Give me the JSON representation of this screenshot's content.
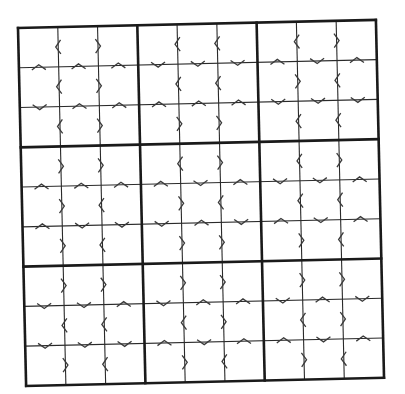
{
  "puzzle": {
    "title": "Greater-Than Sudoku",
    "size": 9,
    "box_size": 3,
    "colors": {
      "background": "#ffffff",
      "thick_line": "#1a1a1a",
      "thin_line": "#2a2a2a",
      "chevron": "#3a3a3a"
    },
    "geometry": {
      "origin_x": 18,
      "origin_y": 28,
      "grid_size": 358,
      "rotation_deg": -1.3
    },
    "legend": {
      "h_symbols": "< means left cell is smaller, > means left cell is greater",
      "v_symbols": "^ means top cell is smaller, v means top cell is greater"
    },
    "boxes": [
      {
        "name": "box-1",
        "rows": [
          [
            "<",
            ">"
          ],
          [
            "<",
            ">"
          ],
          [
            "<",
            ">"
          ]
        ],
        "cols": [
          [
            "^",
            "^",
            "^"
          ],
          [
            "v",
            "^",
            "^"
          ]
        ]
      },
      {
        "name": "box-2",
        "rows": [
          [
            "<",
            "<"
          ],
          [
            "<",
            "<"
          ],
          [
            ">",
            ">"
          ]
        ],
        "cols": [
          [
            "v",
            "v",
            "v"
          ],
          [
            "^",
            "^",
            "^"
          ]
        ]
      },
      {
        "name": "box-3",
        "rows": [
          [
            "<",
            ">"
          ],
          [
            ">",
            "<"
          ],
          [
            "<",
            "<"
          ]
        ],
        "cols": [
          [
            "^",
            "v",
            "^"
          ],
          [
            "v",
            "v",
            "v"
          ]
        ]
      },
      {
        "name": "box-4",
        "rows": [
          [
            ">",
            ">"
          ],
          [
            ">",
            "<"
          ],
          [
            ">",
            "<"
          ]
        ],
        "cols": [
          [
            "^",
            "^",
            "^"
          ],
          [
            "^",
            "v",
            "v"
          ]
        ]
      },
      {
        "name": "box-5",
        "rows": [
          [
            "<",
            ">"
          ],
          [
            ">",
            "<"
          ],
          [
            ">",
            ">"
          ]
        ],
        "cols": [
          [
            "^",
            "v",
            "^"
          ],
          [
            "v",
            "^",
            "v"
          ]
        ]
      },
      {
        "name": "box-6",
        "rows": [
          [
            "<",
            ">"
          ],
          [
            "<",
            "<"
          ],
          [
            ">",
            "<"
          ]
        ],
        "cols": [
          [
            "v",
            "v",
            "^"
          ],
          [
            "^",
            "v",
            "^"
          ]
        ]
      },
      {
        "name": "box-7",
        "rows": [
          [
            ">",
            ">"
          ],
          [
            "<",
            "<"
          ],
          [
            ">",
            "<"
          ]
        ],
        "cols": [
          [
            "v",
            "v",
            "^"
          ],
          [
            "v",
            "v",
            "v"
          ]
        ]
      },
      {
        "name": "box-8",
        "rows": [
          [
            ">",
            ">"
          ],
          [
            "<",
            ">"
          ],
          [
            ">",
            "<"
          ]
        ],
        "cols": [
          [
            "v",
            "^",
            "^"
          ],
          [
            "^",
            "v",
            "^"
          ]
        ]
      },
      {
        "name": "box-9",
        "rows": [
          [
            ">",
            ">"
          ],
          [
            "<",
            ">"
          ],
          [
            ">",
            "<"
          ]
        ],
        "cols": [
          [
            "v",
            "^",
            "v"
          ],
          [
            "^",
            "v",
            "^"
          ]
        ]
      }
    ],
    "cells": "81 empty cells"
  }
}
